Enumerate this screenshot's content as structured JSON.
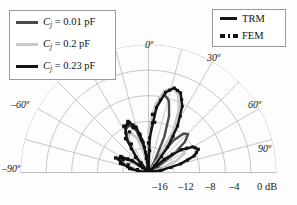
{
  "chart_data": {
    "type": "line",
    "plot_kind": "polar-radiation-pattern",
    "title": "",
    "angular_axis": {
      "label": "",
      "unit": "degrees",
      "range": [
        -90,
        90
      ],
      "tick_step": 15,
      "tick_labels": [
        "-90º",
        "-60º",
        "0º",
        "30º",
        "60º",
        "90º"
      ],
      "tick_values": [
        -90,
        -60,
        0,
        30,
        60,
        90
      ]
    },
    "radial_axis": {
      "label": "dB",
      "range": [
        -20,
        0
      ],
      "tick_values": [
        -16,
        -12,
        -8,
        -4,
        0
      ],
      "tick_labels": [
        "–16",
        "–12",
        "–8",
        "–4",
        "0 dB"
      ],
      "grid": true,
      "rings": [
        -16,
        -12,
        -8,
        -4,
        0
      ]
    },
    "series": [
      {
        "name": "C_j = 0.01 pF",
        "method": "TRM",
        "style": "solid",
        "color": "#4a4a4a",
        "points": [
          [
            -90,
            -20
          ],
          [
            -84,
            -19.2
          ],
          [
            -78,
            -17.6
          ],
          [
            -72,
            -16.0
          ],
          [
            -66,
            -15.0
          ],
          [
            -60,
            -15.6
          ],
          [
            -54,
            -17.4
          ],
          [
            -48,
            -19.4
          ],
          [
            -44,
            -20
          ],
          [
            -40,
            -17.5
          ],
          [
            -34,
            -14.2
          ],
          [
            -28,
            -12.4
          ],
          [
            -22,
            -12.0
          ],
          [
            -16,
            -13.2
          ],
          [
            -12,
            -15.4
          ],
          [
            -8,
            -18.4
          ],
          [
            -5,
            -20
          ],
          [
            0,
            -16.0
          ],
          [
            4,
            -11.5
          ],
          [
            8,
            -8.6
          ],
          [
            12,
            -7.6
          ],
          [
            16,
            -8.4
          ],
          [
            20,
            -10.6
          ],
          [
            24,
            -14.0
          ],
          [
            28,
            -18.0
          ],
          [
            31,
            -20
          ],
          [
            34,
            -17.0
          ],
          [
            38,
            -13.6
          ],
          [
            42,
            -11.8
          ],
          [
            46,
            -11.4
          ],
          [
            50,
            -12.6
          ],
          [
            54,
            -15.2
          ],
          [
            58,
            -18.6
          ],
          [
            62,
            -20
          ],
          [
            68,
            -18.4
          ],
          [
            74,
            -17.2
          ],
          [
            80,
            -17.6
          ],
          [
            86,
            -19.0
          ],
          [
            90,
            -20
          ]
        ]
      },
      {
        "name": "C_j = 0.2 pF",
        "method": "TRM",
        "style": "solid",
        "color": "#c9c9c9",
        "points": [
          [
            -90,
            -20
          ],
          [
            -84,
            -19.4
          ],
          [
            -78,
            -18.2
          ],
          [
            -72,
            -17.0
          ],
          [
            -66,
            -16.4
          ],
          [
            -60,
            -16.8
          ],
          [
            -54,
            -18.4
          ],
          [
            -48,
            -20
          ],
          [
            -42,
            -18.2
          ],
          [
            -36,
            -15.4
          ],
          [
            -30,
            -13.6
          ],
          [
            -24,
            -13.2
          ],
          [
            -18,
            -14.4
          ],
          [
            -13,
            -16.8
          ],
          [
            -9,
            -19.6
          ],
          [
            -6,
            -20
          ],
          [
            0,
            -13.4
          ],
          [
            6,
            -9.2
          ],
          [
            11,
            -7.0
          ],
          [
            16,
            -6.2
          ],
          [
            21,
            -7.0
          ],
          [
            26,
            -9.2
          ],
          [
            31,
            -12.6
          ],
          [
            36,
            -16.4
          ],
          [
            40,
            -19.8
          ],
          [
            43,
            -20
          ],
          [
            47,
            -17.6
          ],
          [
            52,
            -14.8
          ],
          [
            57,
            -13.4
          ],
          [
            62,
            -13.6
          ],
          [
            67,
            -15.2
          ],
          [
            72,
            -17.8
          ],
          [
            77,
            -20
          ],
          [
            82,
            -19.0
          ],
          [
            86,
            -18.6
          ],
          [
            90,
            -19.6
          ]
        ]
      },
      {
        "name": "C_j = 0.23 pF",
        "method": "TRM",
        "style": "solid",
        "color": "#141414",
        "points": [
          [
            -90,
            -20
          ],
          [
            -84,
            -19.0
          ],
          [
            -78,
            -17.4
          ],
          [
            -72,
            -15.8
          ],
          [
            -66,
            -14.8
          ],
          [
            -60,
            -15.2
          ],
          [
            -54,
            -17.0
          ],
          [
            -48,
            -19.4
          ],
          [
            -44,
            -20
          ],
          [
            -39,
            -17.0
          ],
          [
            -33,
            -13.8
          ],
          [
            -27,
            -12.0
          ],
          [
            -21,
            -11.6
          ],
          [
            -15,
            -12.8
          ],
          [
            -10,
            -15.2
          ],
          [
            -6,
            -18.4
          ],
          [
            -3,
            -20
          ],
          [
            2,
            -14.6
          ],
          [
            7,
            -9.8
          ],
          [
            12,
            -7.2
          ],
          [
            17,
            -6.2
          ],
          [
            22,
            -6.6
          ],
          [
            27,
            -8.4
          ],
          [
            32,
            -11.4
          ],
          [
            37,
            -15.0
          ],
          [
            42,
            -18.6
          ],
          [
            45,
            -20
          ],
          [
            50,
            -16.8
          ],
          [
            55,
            -13.8
          ],
          [
            60,
            -12.0
          ],
          [
            65,
            -11.4
          ],
          [
            70,
            -12.4
          ],
          [
            75,
            -14.8
          ],
          [
            80,
            -18.0
          ],
          [
            84,
            -20
          ],
          [
            88,
            -19.2
          ],
          [
            90,
            -18.8
          ]
        ]
      },
      {
        "name": "FEM overlay",
        "method": "FEM",
        "style": "dotted-markers",
        "color": "#111111",
        "marker": "square",
        "points": [
          [
            -72,
            -16.2
          ],
          [
            -66,
            -15.2
          ],
          [
            -60,
            -15.8
          ],
          [
            -54,
            -17.6
          ],
          [
            -48,
            -19.6
          ],
          [
            -40,
            -17.8
          ],
          [
            -34,
            -14.4
          ],
          [
            -28,
            -12.6
          ],
          [
            -22,
            -12.2
          ],
          [
            -16,
            -13.4
          ],
          [
            -10,
            -16.2
          ],
          [
            -4,
            -19.4
          ],
          [
            2,
            -14.8
          ],
          [
            8,
            -9.6
          ],
          [
            14,
            -6.8
          ],
          [
            20,
            -7.0
          ],
          [
            26,
            -8.8
          ],
          [
            32,
            -11.8
          ],
          [
            38,
            -15.6
          ],
          [
            44,
            -19.2
          ],
          [
            52,
            -14.4
          ],
          [
            58,
            -12.4
          ],
          [
            64,
            -11.8
          ],
          [
            70,
            -12.8
          ],
          [
            76,
            -15.4
          ],
          [
            82,
            -18.6
          ]
        ]
      }
    ],
    "legend_position": "top-left and top-right"
  },
  "legend_left": {
    "items": [
      {
        "id": "cj-001",
        "var": "C",
        "sub": "j",
        "text": " = 0.01 pF",
        "color": "#4a4a4a"
      },
      {
        "id": "cj-02",
        "var": "C",
        "sub": "j",
        "text": " = 0.2 pF",
        "color": "#c9c9c9"
      },
      {
        "id": "cj-023",
        "var": "C",
        "sub": "j",
        "text": " = 0.23 pF",
        "color": "#141414"
      }
    ]
  },
  "legend_right": {
    "items": [
      {
        "id": "trm",
        "label": "TRM",
        "style": "solid",
        "color": "#141414"
      },
      {
        "id": "fem",
        "label": "FEM",
        "style": "dotted",
        "color": "#141414"
      }
    ]
  },
  "angle_labels": {
    "neg90": "–90º",
    "neg60": "–60º",
    "zero": "0º",
    "pos30": "30º",
    "pos60": "60º",
    "pos90": "90º"
  },
  "radial_labels": {
    "m16": "–16",
    "m12": "–12",
    "m8": "–8",
    "m4": "–4",
    "zero": "0 dB"
  },
  "colors": {
    "grid": "#b9b9b9",
    "text": "#1a1a1a",
    "background": "#fdfdfd"
  }
}
